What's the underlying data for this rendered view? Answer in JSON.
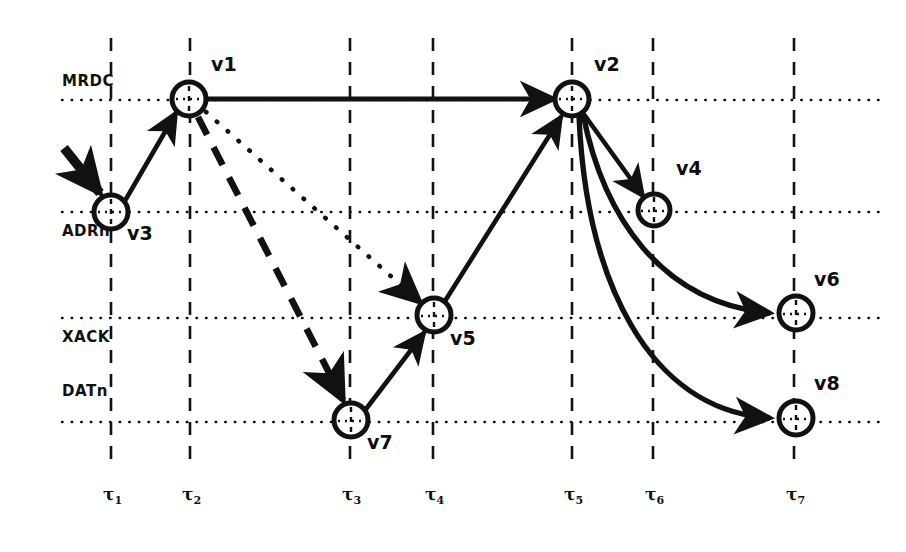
{
  "figure": {
    "type": "signal-transition-graph",
    "width": 906,
    "height": 552,
    "background": "#ffffff",
    "ink_color": "#111111"
  },
  "signals": {
    "label_color": "#111111",
    "rows": [
      {
        "name": "MRDC",
        "label": "MRDC",
        "y": 100
      },
      {
        "name": "ADRn",
        "label": "ADRn",
        "y": 212
      },
      {
        "name": "XACK",
        "label": "XACK",
        "y": 318
      },
      {
        "name": "DATn",
        "label": "DATn",
        "y": 422
      }
    ]
  },
  "time_axis": {
    "ticks": [
      {
        "name": "tau1",
        "symbol": "τ",
        "subscript": "1",
        "x": 111
      },
      {
        "name": "tau2",
        "symbol": "τ",
        "subscript": "2",
        "x": 190
      },
      {
        "name": "tau3",
        "symbol": "τ",
        "subscript": "3",
        "x": 350
      },
      {
        "name": "tau4",
        "symbol": "τ",
        "subscript": "4",
        "x": 433
      },
      {
        "name": "tau5",
        "symbol": "τ",
        "subscript": "5",
        "x": 572
      },
      {
        "name": "tau6",
        "symbol": "τ",
        "subscript": "6",
        "x": 653
      },
      {
        "name": "tau7",
        "symbol": "τ",
        "subscript": "7",
        "x": 794
      }
    ],
    "line_top": 38,
    "line_bottom": 468,
    "label_y": 490
  },
  "nodes": [
    {
      "id": "v1",
      "label": "v1",
      "x": 189,
      "y": 99,
      "r": 17,
      "signal": "MRDC",
      "time": "tau2",
      "label_dx": 22,
      "label_dy": -32
    },
    {
      "id": "v2",
      "label": "v2",
      "x": 572,
      "y": 99,
      "r": 17,
      "signal": "MRDC",
      "time": "tau5",
      "label_dx": 22,
      "label_dy": -32
    },
    {
      "id": "v3",
      "label": "v3",
      "x": 111,
      "y": 212,
      "r": 17,
      "signal": "ADRn",
      "time": "tau1",
      "label_dx": 16,
      "label_dy": 14
    },
    {
      "id": "v4",
      "label": "v4",
      "x": 654,
      "y": 210,
      "r": 16,
      "signal": "ADRn",
      "time": "tau6",
      "label_dx": 22,
      "label_dy": -32
    },
    {
      "id": "v5",
      "label": "v5",
      "x": 434,
      "y": 315,
      "r": 17,
      "signal": "XACK",
      "time": "tau4",
      "label_dx": 16,
      "label_dy": 14
    },
    {
      "id": "v6",
      "label": "v6",
      "x": 796,
      "y": 313,
      "r": 17,
      "signal": "XACK",
      "time": "tau7",
      "label_dx": 18,
      "label_dy": -32
    },
    {
      "id": "v7",
      "label": "v7",
      "x": 351,
      "y": 420,
      "r": 17,
      "signal": "DATn",
      "time": "tau3",
      "label_dx": 16,
      "label_dy": 14
    },
    {
      "id": "v8",
      "label": "v8",
      "x": 796,
      "y": 418,
      "r": 17,
      "signal": "DATn",
      "time": "tau7",
      "label_dx": 18,
      "label_dy": -32
    }
  ],
  "edges": [
    {
      "name": "edge-entry-v3",
      "from": "start",
      "to": "v3",
      "style": "solid-thick",
      "arrow": true
    },
    {
      "name": "edge-v3-v1",
      "from": "v3",
      "to": "v1",
      "style": "solid",
      "arrow": true
    },
    {
      "name": "edge-v1-v2",
      "from": "v1",
      "to": "v2",
      "style": "solid",
      "arrow": true
    },
    {
      "name": "edge-v1-v7",
      "from": "v1",
      "to": "v7",
      "style": "dashed",
      "arrow": true
    },
    {
      "name": "edge-v1-v5",
      "from": "v1",
      "to": "v5",
      "style": "dotted",
      "arrow": true
    },
    {
      "name": "edge-v7-v5",
      "from": "v7",
      "to": "v5",
      "style": "solid",
      "arrow": true
    },
    {
      "name": "edge-v5-v2",
      "from": "v5",
      "to": "v2",
      "style": "solid",
      "arrow": true
    },
    {
      "name": "edge-v2-v4",
      "from": "v2",
      "to": "v4",
      "style": "solid",
      "arrow": true
    },
    {
      "name": "edge-v2-v6",
      "from": "v2",
      "to": "v6",
      "style": "curved",
      "arrow": true
    },
    {
      "name": "edge-v2-v8",
      "from": "v2",
      "to": "v8",
      "style": "curved",
      "arrow": true
    }
  ]
}
